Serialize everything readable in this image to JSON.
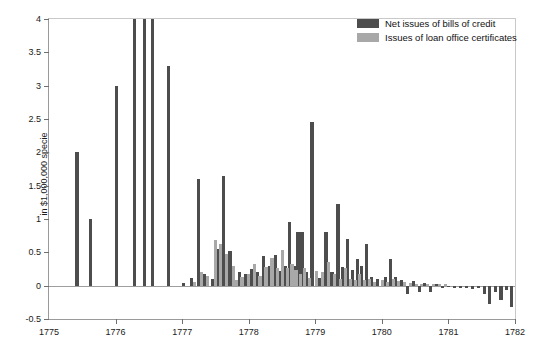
{
  "chart_data": {
    "type": "bar",
    "title": "",
    "subtitle": "",
    "xlabel": "",
    "ylabel": "in $1,000,000 specie",
    "xlim": [
      1775,
      1782
    ],
    "ylim": [
      -0.5,
      4
    ],
    "grid": false,
    "legend_position": "top-right",
    "xticks": [
      "1775",
      "1776",
      "1777",
      "1778",
      "1779",
      "1780",
      "1781",
      "1782"
    ],
    "xtick_values": [
      1775,
      1776,
      1777,
      1778,
      1779,
      1780,
      1781,
      1782
    ],
    "yticks": [
      "-0.5",
      "0",
      "0.5",
      "1",
      "1.5",
      "2",
      "2.5",
      "3",
      "3.5",
      "4"
    ],
    "ytick_values": [
      -0.5,
      0,
      0.5,
      1,
      1.5,
      2,
      2.5,
      3,
      3.5,
      4
    ],
    "series": [
      {
        "name": "Net issues of bills of credit",
        "color": "#4d4d4d",
        "points": [
          {
            "x": 1775.42,
            "y": 2.0
          },
          {
            "x": 1775.62,
            "y": 1.0
          },
          {
            "x": 1776.02,
            "y": 3.0
          },
          {
            "x": 1776.28,
            "y": 4.0
          },
          {
            "x": 1776.44,
            "y": 4.0
          },
          {
            "x": 1776.56,
            "y": 4.0
          },
          {
            "x": 1776.8,
            "y": 3.3
          },
          {
            "x": 1777.02,
            "y": 0.04
          },
          {
            "x": 1777.14,
            "y": 0.12
          },
          {
            "x": 1777.24,
            "y": 1.6
          },
          {
            "x": 1777.33,
            "y": 0.17
          },
          {
            "x": 1777.45,
            "y": 0.1
          },
          {
            "x": 1777.55,
            "y": 0.55
          },
          {
            "x": 1777.62,
            "y": 1.65
          },
          {
            "x": 1777.72,
            "y": 0.52
          },
          {
            "x": 1777.86,
            "y": 0.2
          },
          {
            "x": 1777.95,
            "y": 0.17
          },
          {
            "x": 1778.04,
            "y": 0.25
          },
          {
            "x": 1778.13,
            "y": 0.2
          },
          {
            "x": 1778.22,
            "y": 0.44
          },
          {
            "x": 1778.31,
            "y": 0.3
          },
          {
            "x": 1778.4,
            "y": 0.46
          },
          {
            "x": 1778.47,
            "y": 0.22
          },
          {
            "x": 1778.55,
            "y": 0.3
          },
          {
            "x": 1778.61,
            "y": 0.96
          },
          {
            "x": 1778.68,
            "y": 0.3
          },
          {
            "x": 1778.74,
            "y": 0.8
          },
          {
            "x": 1778.8,
            "y": 0.8
          },
          {
            "x": 1778.87,
            "y": 0.2
          },
          {
            "x": 1778.95,
            "y": 2.45
          },
          {
            "x": 1779.07,
            "y": 0.12
          },
          {
            "x": 1779.16,
            "y": 0.8
          },
          {
            "x": 1779.25,
            "y": 0.2
          },
          {
            "x": 1779.34,
            "y": 1.22
          },
          {
            "x": 1779.41,
            "y": 0.28
          },
          {
            "x": 1779.49,
            "y": 0.7
          },
          {
            "x": 1779.56,
            "y": 0.24
          },
          {
            "x": 1779.63,
            "y": 0.4
          },
          {
            "x": 1779.7,
            "y": 0.3
          },
          {
            "x": 1779.77,
            "y": 0.62
          },
          {
            "x": 1779.85,
            "y": 0.13
          },
          {
            "x": 1779.93,
            "y": 0.1
          },
          {
            "x": 1780.05,
            "y": 0.13
          },
          {
            "x": 1780.13,
            "y": 0.4
          },
          {
            "x": 1780.21,
            "y": 0.13
          },
          {
            "x": 1780.3,
            "y": 0.09
          },
          {
            "x": 1780.38,
            "y": -0.12
          },
          {
            "x": 1780.47,
            "y": 0.07
          },
          {
            "x": 1780.56,
            "y": -0.1
          },
          {
            "x": 1780.64,
            "y": 0.04
          },
          {
            "x": 1780.73,
            "y": -0.1
          },
          {
            "x": 1780.82,
            "y": 0.03
          },
          {
            "x": 1780.91,
            "y": -0.04
          },
          {
            "x": 1781.0,
            "y": -0.02
          },
          {
            "x": 1781.09,
            "y": -0.03
          },
          {
            "x": 1781.18,
            "y": -0.03
          },
          {
            "x": 1781.27,
            "y": -0.04
          },
          {
            "x": 1781.36,
            "y": -0.05
          },
          {
            "x": 1781.45,
            "y": -0.04
          },
          {
            "x": 1781.54,
            "y": -0.12
          },
          {
            "x": 1781.62,
            "y": -0.28
          },
          {
            "x": 1781.71,
            "y": -0.1
          },
          {
            "x": 1781.79,
            "y": -0.21
          },
          {
            "x": 1781.87,
            "y": -0.06
          },
          {
            "x": 1781.95,
            "y": -0.32
          }
        ]
      },
      {
        "name": "Issues of loan office certificates",
        "color": "#a8a8a8",
        "points": [
          {
            "x": 1777.19,
            "y": 0.05
          },
          {
            "x": 1777.29,
            "y": 0.2
          },
          {
            "x": 1777.38,
            "y": 0.14
          },
          {
            "x": 1777.5,
            "y": 0.68
          },
          {
            "x": 1777.58,
            "y": 0.62
          },
          {
            "x": 1777.67,
            "y": 0.48
          },
          {
            "x": 1777.77,
            "y": 0.3
          },
          {
            "x": 1777.82,
            "y": 0.08
          },
          {
            "x": 1777.9,
            "y": 0.13
          },
          {
            "x": 1778.0,
            "y": 0.17
          },
          {
            "x": 1778.09,
            "y": 0.33
          },
          {
            "x": 1778.17,
            "y": 0.14
          },
          {
            "x": 1778.26,
            "y": 0.28
          },
          {
            "x": 1778.35,
            "y": 0.42
          },
          {
            "x": 1778.43,
            "y": 0.26
          },
          {
            "x": 1778.51,
            "y": 0.54
          },
          {
            "x": 1778.58,
            "y": 0.26
          },
          {
            "x": 1778.65,
            "y": 0.32
          },
          {
            "x": 1778.71,
            "y": 0.24
          },
          {
            "x": 1778.78,
            "y": 0.17
          },
          {
            "x": 1778.84,
            "y": 0.27
          },
          {
            "x": 1778.91,
            "y": 0.12
          },
          {
            "x": 1779.02,
            "y": 0.22
          },
          {
            "x": 1779.11,
            "y": 0.21
          },
          {
            "x": 1779.2,
            "y": 0.36
          },
          {
            "x": 1779.29,
            "y": 0.18
          },
          {
            "x": 1779.38,
            "y": 0.1
          },
          {
            "x": 1779.45,
            "y": 0.26
          },
          {
            "x": 1779.53,
            "y": 0.1
          },
          {
            "x": 1779.6,
            "y": 0.08
          },
          {
            "x": 1779.67,
            "y": 0.18
          },
          {
            "x": 1779.74,
            "y": 0.08
          },
          {
            "x": 1779.81,
            "y": 0.1
          },
          {
            "x": 1779.89,
            "y": 0.05
          },
          {
            "x": 1780.01,
            "y": 0.08
          },
          {
            "x": 1780.09,
            "y": 0.06
          },
          {
            "x": 1780.17,
            "y": 0.1
          },
          {
            "x": 1780.25,
            "y": 0.07
          },
          {
            "x": 1780.34,
            "y": 0.05
          },
          {
            "x": 1780.43,
            "y": 0.04
          },
          {
            "x": 1780.52,
            "y": 0.03
          },
          {
            "x": 1780.6,
            "y": 0.03
          },
          {
            "x": 1780.69,
            "y": 0.02
          },
          {
            "x": 1780.78,
            "y": 0.02
          },
          {
            "x": 1780.87,
            "y": 0.02
          },
          {
            "x": 1780.96,
            "y": 0.02
          }
        ]
      }
    ]
  },
  "legend": {
    "items": [
      {
        "label": "Net issues of bills of credit",
        "color": "#4d4d4d"
      },
      {
        "label": "Issues of loan office certificates",
        "color": "#a8a8a8"
      }
    ]
  },
  "axis": {
    "y_title": "in $1,000,000 specie"
  }
}
